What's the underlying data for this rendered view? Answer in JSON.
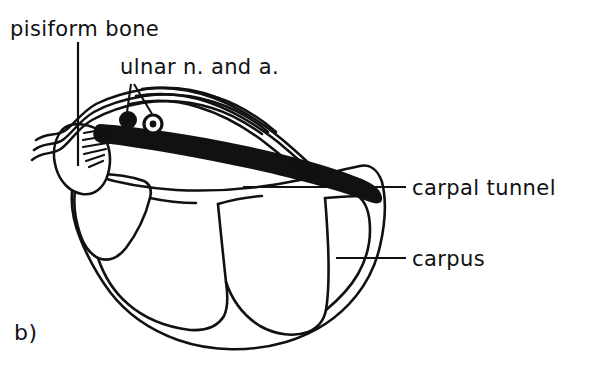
{
  "figure": {
    "panel_label": "b)",
    "caption_subject": "cross-section of the wrist at the carpal tunnel",
    "ink_color": "#111111",
    "background_color": "#ffffff"
  },
  "annotations": [
    {
      "id": "pisiform-bone",
      "label": "pisiform bone",
      "text_x": 10,
      "text_y": 36,
      "leader": "vertical line descending into the pisiform bone"
    },
    {
      "id": "ulnar-neurovascular",
      "label": "ulnar n. and a.",
      "text_x": 120,
      "text_y": 74,
      "leader": "two short diverging lines to nerve and artery"
    },
    {
      "id": "carpal-tunnel",
      "label": "carpal tunnel",
      "text_x": 412,
      "text_y": 193,
      "leader": "horizontal line into the tunnel space"
    },
    {
      "id": "carpus",
      "label": "carpus",
      "text_x": 412,
      "text_y": 264,
      "leader": "horizontal line onto the carpal bone mass"
    }
  ],
  "structures": [
    {
      "id": "pisiform",
      "name": "pisiform bone",
      "kind": "bone-outline"
    },
    {
      "id": "hamate",
      "name": "hamate",
      "kind": "bone-outline"
    },
    {
      "id": "capitate",
      "name": "capitate",
      "kind": "bone-outline"
    },
    {
      "id": "trapezoid",
      "name": "trapezoid",
      "kind": "bone-outline"
    },
    {
      "id": "trapezium",
      "name": "trapezium",
      "kind": "bone-outline"
    },
    {
      "id": "flexor-retinaculum",
      "name": "flexor retinaculum",
      "kind": "solid-black-band"
    },
    {
      "id": "ulnar-nerve",
      "name": "ulnar nerve",
      "kind": "filled-circle"
    },
    {
      "id": "ulnar-artery",
      "name": "ulnar artery",
      "kind": "ring-circle"
    },
    {
      "id": "superficial-fascia",
      "name": "superficial fascia",
      "kind": "wavy-lines"
    },
    {
      "id": "carpal-tunnel-space",
      "name": "carpal tunnel",
      "kind": "enclosed-space"
    }
  ]
}
